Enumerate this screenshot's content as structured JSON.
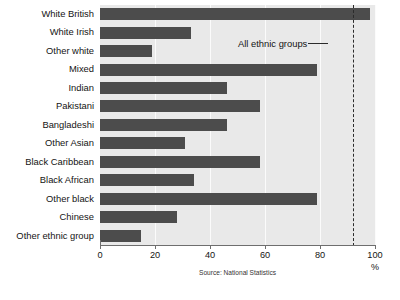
{
  "chart_data": {
    "type": "bar",
    "orientation": "horizontal",
    "title": "",
    "xlabel": "%",
    "ylabel": "",
    "xlim": [
      0,
      100
    ],
    "xticks": [
      0,
      20,
      40,
      60,
      80,
      100
    ],
    "grid": true,
    "grid_axis": "x",
    "legend": "none",
    "categories": [
      "White British",
      "White Irish",
      "Other white",
      "Mixed",
      "Indian",
      "Pakistani",
      "Bangladeshi",
      "Other Asian",
      "Black Caribbean",
      "Black African",
      "Other black",
      "Chinese",
      "Other ethnic group"
    ],
    "values": [
      98,
      33,
      19,
      79,
      46,
      58,
      46,
      31,
      58,
      34,
      79,
      28,
      15
    ],
    "annotations": [
      {
        "label": "All ethnic groups",
        "value": 92,
        "style": "dashed-vertical-line"
      }
    ],
    "source": "Source: National Statistics",
    "colors": {
      "bar": "#4c4c4c",
      "plot_background": "#e9e9e9",
      "gridline": "#fbfbfb",
      "reference_line": "#2b2b2b",
      "axis": "#6e6e6e",
      "text": "#141414",
      "page_background": "#ffffff"
    }
  }
}
